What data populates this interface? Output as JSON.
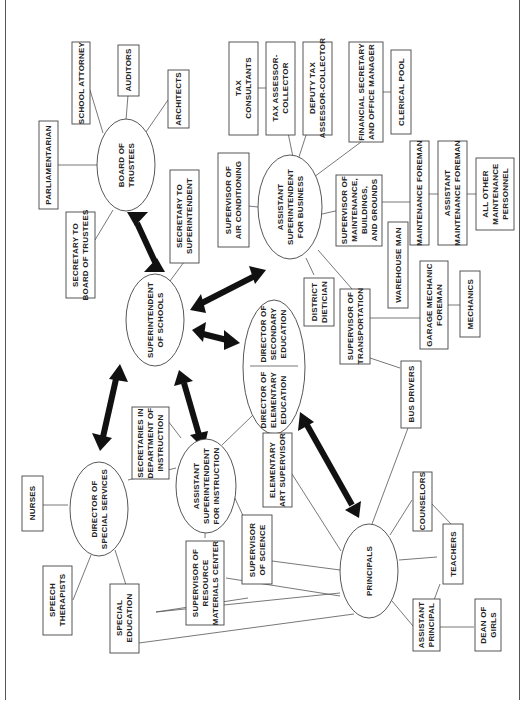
{
  "diagram": {
    "orientation": "rotated -90deg",
    "colors": {
      "line": "#555555",
      "arrow": "#111111",
      "text": "#222222",
      "background": "#ffffff"
    },
    "ellipses": {
      "board": [
        "BOARD OF",
        "TRUSTEES"
      ],
      "superintendent": [
        "SUPERINTENDENT",
        "OF SCHOOLS"
      ],
      "asst_business": [
        "ASSISTANT",
        "SUPERINTENDENT",
        "FOR BUSINESS"
      ],
      "directors_elem": [
        "DIRECTOR OF",
        "ELEMENTARY",
        "EDUCATION"
      ],
      "directors_sec": [
        "DIRECTOR OF",
        "SECONDARY",
        "EDUCATION"
      ],
      "asst_instruction": [
        "ASSISTANT",
        "SUPERINTENDENT",
        "FOR INSTRUCTION"
      ],
      "special_services": [
        "DIRECTOR OF",
        "SPECIAL SERVICES"
      ],
      "principals": [
        "PRINCIPALS"
      ]
    },
    "boxes": {
      "school_attorney": [
        "SCHOOL ATTORNEY"
      ],
      "auditors": [
        "AUDITORS"
      ],
      "architects": [
        "ARCHITECTS"
      ],
      "parliamentarian": [
        "PARLIAMENTARIAN"
      ],
      "secretary_board": [
        "SECRETARY TO",
        "BOARD OF TRUSTEES"
      ],
      "secretary_super": [
        "SECRETARY TO",
        "SUPERINTENDENT"
      ],
      "tax_consultants": [
        "TAX",
        "CONSULTANTS"
      ],
      "tax_assessor": [
        "TAX ASSESSOR-",
        "COLLECTOR"
      ],
      "deputy_tax": [
        "DEPUTY TAX",
        "ASSESSOR-COLLECTOR"
      ],
      "financial_secretary": [
        "FINANCIAL SECRETARY",
        "AND OFFICE MANAGER"
      ],
      "clerical_pool": [
        "CLERICAL POOL"
      ],
      "air_conditioning": [
        "SUPERVISOR OF",
        "AIR CONDITIONING"
      ],
      "maintenance_sup": [
        "SUPERVISOR OF",
        "MAINTENANCE,",
        "BUILDINGS,",
        "AND GROUNDS"
      ],
      "maintenance_foreman": [
        "MAINTENANCE FOREMAN"
      ],
      "asst_maintenance_foreman": [
        "ASSISTANT",
        "MAINTENANCE FOREMAN"
      ],
      "other_maintenance": [
        "ALL OTHER",
        "MAINTENANCE",
        "PERSONNEL"
      ],
      "warehouse": [
        "WAREHOUSE MAN"
      ],
      "dietician": [
        "DISTRICT",
        "DIETICIAN"
      ],
      "transportation": [
        "SUPERVISOR OF",
        "TRANSPORTATION"
      ],
      "garage_foreman": [
        "GARAGE MECHANIC",
        "FOREMAN"
      ],
      "mechanics": [
        "MECHANICS"
      ],
      "bus_drivers": [
        "BUS DRIVERS"
      ],
      "secretaries_instruction": [
        "SECRETARIES IN",
        "DEPARTMENT OF",
        "INSTRUCTION"
      ],
      "elem_art": [
        "ELEMENTARY",
        "ART SUPERVISOR"
      ],
      "nurses": [
        "NURSES"
      ],
      "speech": [
        "SPEECH",
        "THERAPISTS"
      ],
      "special_ed": [
        "SPECIAL",
        "EDUCATION"
      ],
      "resource_center": [
        "SUPERVISOR OF",
        "RESOURCE",
        "MATERIALS CENTER"
      ],
      "science": [
        "SUPERVISOR",
        "OF SCIENCE"
      ],
      "counselors": [
        "COUNSELORS"
      ],
      "teachers": [
        "TEACHERS"
      ],
      "asst_principal": [
        "ASSISTANT",
        "PRINCIPAL"
      ],
      "dean_girls": [
        "DEAN OF",
        "GIRLS"
      ]
    }
  }
}
